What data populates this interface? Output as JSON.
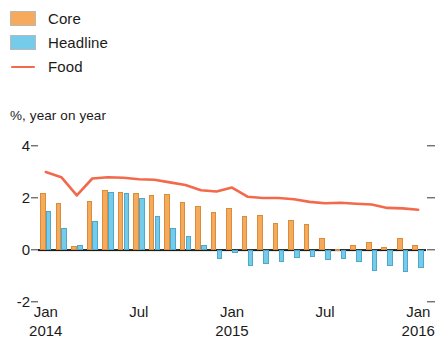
{
  "legend": {
    "items": [
      {
        "label": "Core",
        "type": "bar",
        "color": "#F6AB5C"
      },
      {
        "label": "Headline",
        "type": "bar",
        "color": "#74CBEA"
      },
      {
        "label": "Food",
        "type": "line",
        "color": "#F2694C"
      }
    ]
  },
  "axis_caption": "%, year on year",
  "chart_data": {
    "type": "bar",
    "title": "",
    "subtitle": "",
    "xlabel": "",
    "ylabel": "%, year on year",
    "ylim": [
      -2,
      4
    ],
    "yticks": [
      4,
      2,
      0,
      -2
    ],
    "ytick_labels": [
      "4",
      "2",
      "0",
      "-2"
    ],
    "grid": false,
    "legend_position": "top-left",
    "x": [
      "Jan 2014",
      "Feb 2014",
      "Mar 2014",
      "Apr 2014",
      "May 2014",
      "Jun 2014",
      "Jul 2014",
      "Aug 2014",
      "Sep 2014",
      "Oct 2014",
      "Nov 2014",
      "Dec 2014",
      "Jan 2015",
      "Feb 2015",
      "Mar 2015",
      "Apr 2015",
      "May 2015",
      "Jun 2015",
      "Jul 2015",
      "Aug 2015",
      "Sep 2015",
      "Oct 2015",
      "Nov 2015",
      "Dec 2015",
      "Jan 2016"
    ],
    "xtick_labels": [
      {
        "month": "Jan",
        "year": "2014",
        "index": 0
      },
      {
        "month": "Jul",
        "year": "",
        "index": 6
      },
      {
        "month": "Jan",
        "year": "2015",
        "index": 12
      },
      {
        "month": "Jul",
        "year": "",
        "index": 18
      },
      {
        "month": "Jan",
        "year": "2016",
        "index": 24
      }
    ],
    "series": [
      {
        "name": "Core",
        "type": "bar",
        "color": "#F6AB5C",
        "values": [
          2.2,
          1.8,
          0.15,
          1.9,
          2.3,
          2.25,
          2.2,
          2.1,
          2.15,
          1.85,
          1.7,
          1.45,
          1.6,
          1.3,
          1.35,
          1.05,
          1.15,
          1.0,
          0.45,
          0.05,
          0.2,
          0.3,
          0.1,
          0.45,
          0.2
        ]
      },
      {
        "name": "Headline",
        "type": "bar",
        "color": "#74CBEA",
        "values": [
          1.5,
          0.85,
          0.2,
          1.1,
          2.25,
          2.2,
          2.0,
          1.3,
          0.85,
          0.55,
          0.2,
          -0.35,
          -0.1,
          -0.6,
          -0.55,
          -0.45,
          -0.3,
          -0.25,
          -0.4,
          -0.35,
          -0.45,
          -0.8,
          -0.6,
          -0.85,
          -0.7
        ]
      },
      {
        "name": "Food",
        "type": "line",
        "color": "#F2694C",
        "values": [
          3.0,
          2.8,
          2.1,
          2.75,
          2.8,
          2.78,
          2.72,
          2.7,
          2.6,
          2.5,
          2.3,
          2.25,
          2.4,
          2.05,
          2.0,
          2.0,
          1.95,
          1.85,
          1.8,
          1.82,
          1.78,
          1.75,
          1.62,
          1.6,
          1.55
        ]
      }
    ]
  }
}
